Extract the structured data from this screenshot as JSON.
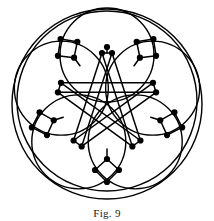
{
  "figure": {
    "caption": "Fig. 9",
    "title": "Fig. 9",
    "colors": {
      "stroke": "#000000",
      "background": "#ffffff",
      "node_fill": "#000000",
      "caption": "#1a1a1a"
    },
    "geometry": {
      "canvas_width": 214,
      "canvas_height": 221,
      "center_x": 107,
      "center_y": 103,
      "outer_circle_radius": 95,
      "outer_circle_radius_inner": 90,
      "petal_circle_count": 5,
      "petal_circle_radius": 47,
      "petal_center_radius": 48,
      "rotation_offset_deg": -90,
      "star_points": 5,
      "star_outer_radius": 50,
      "star_inner_radius": 19,
      "star_double_offset": 5,
      "node_radius": 3.1,
      "stroke_width": 1.5
    },
    "counts": {
      "circles": 6,
      "kites": 5,
      "nodes_total": 30,
      "star_edges": 10
    }
  }
}
